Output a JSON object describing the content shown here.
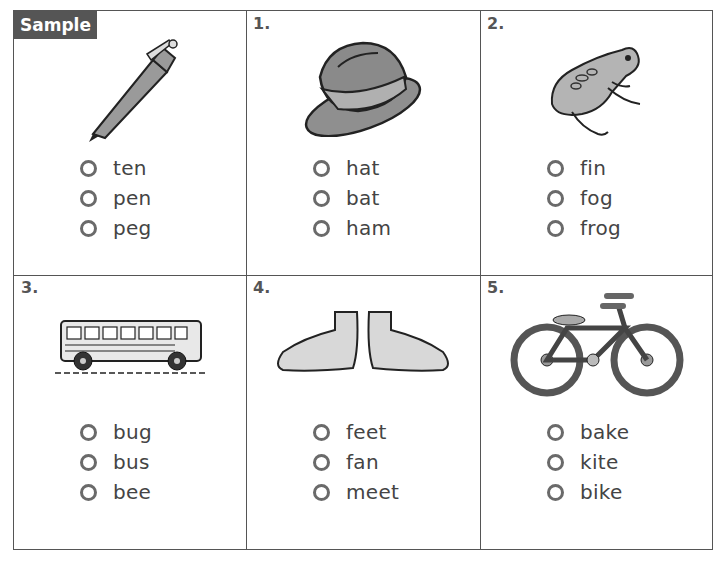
{
  "sample_label": "Sample",
  "items": [
    {
      "number": "",
      "picture": "pen-icon",
      "choices": [
        "ten",
        "pen",
        "peg"
      ]
    },
    {
      "number": "1.",
      "picture": "hat-icon",
      "choices": [
        "hat",
        "bat",
        "ham"
      ]
    },
    {
      "number": "2.",
      "picture": "frog-icon",
      "choices": [
        "fin",
        "fog",
        "frog"
      ]
    },
    {
      "number": "3.",
      "picture": "school-bus-icon",
      "choices": [
        "bug",
        "bus",
        "bee"
      ]
    },
    {
      "number": "4.",
      "picture": "feet-icon",
      "choices": [
        "feet",
        "fan",
        "meet"
      ]
    },
    {
      "number": "5.",
      "picture": "bicycle-icon",
      "choices": [
        "bake",
        "kite",
        "bike"
      ]
    }
  ],
  "colors": {
    "border": "#555555",
    "tag_bg": "#555555",
    "picture_fill": "#a0a0a0"
  }
}
